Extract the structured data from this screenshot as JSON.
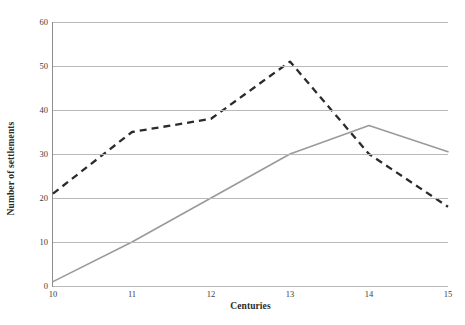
{
  "chart_data": {
    "type": "line",
    "title": "",
    "xlabel": "Centuries",
    "ylabel": "Number of settlements",
    "categories": [
      "10",
      "11",
      "12",
      "13",
      "14",
      "15"
    ],
    "x": [
      10,
      11,
      12,
      13,
      14,
      15
    ],
    "xlim": [
      10,
      15
    ],
    "ylim": [
      0,
      60
    ],
    "yticks": [
      0,
      10,
      20,
      30,
      40,
      50,
      60
    ],
    "xticks": [
      10,
      11,
      12,
      13,
      14,
      15
    ],
    "grid": "horizontal",
    "legend": "none",
    "series": [
      {
        "name": "dashed-series",
        "style": "dashed",
        "color": "#2b2b2b",
        "values": [
          21,
          35,
          38,
          51,
          30,
          18
        ]
      },
      {
        "name": "solid-series",
        "style": "solid",
        "color": "#9a9a9a",
        "values": [
          1,
          10,
          20,
          30,
          36.5,
          30.5
        ]
      }
    ]
  },
  "axes": {
    "y_tick_labels": [
      "60",
      "50",
      "40",
      "30",
      "20",
      "10",
      "0"
    ],
    "x_tick_labels": [
      "10",
      "11",
      "12",
      "13",
      "14",
      "15"
    ],
    "y_axis_title": "Number of settlements",
    "x_axis_title": "Centuries"
  },
  "colors": {
    "background": "#ffffff",
    "gridline": "#b9b9b9",
    "axis_line": "#8d8d8d",
    "series_dashed": "#2b2b2b",
    "series_solid": "#9a9a9a",
    "tick_text": "#3d3d3d",
    "title_text": "#2c2c2c"
  }
}
